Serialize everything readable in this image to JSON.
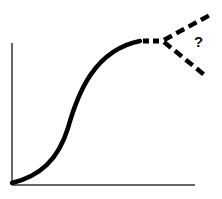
{
  "diagram": {
    "type": "s-curve-with-uncertain-future",
    "annotation": "?",
    "colors": {
      "curve": "#000000",
      "axis": "#333333",
      "background": "#ffffff"
    },
    "axes": {
      "x_label": "",
      "y_label": ""
    },
    "branches": [
      "upward",
      "downward"
    ]
  }
}
